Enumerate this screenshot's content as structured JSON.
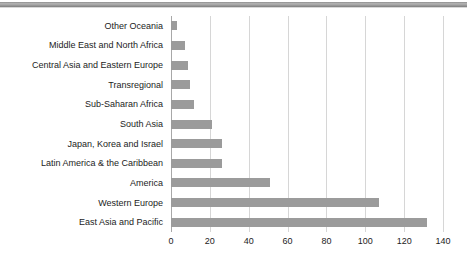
{
  "chart_data": {
    "type": "bar",
    "orientation": "horizontal",
    "title": "",
    "subtitle": "",
    "xlabel": "",
    "ylabel": "",
    "categories": [
      "Other Oceania",
      "Middle East and North Africa",
      "Central Asia and Eastern Europe",
      "Transregional",
      "Sub-Saharan Africa",
      "South Asia",
      "Japan, Korea and Israel",
      "Latin America & the Caribbean",
      "America",
      "Western Europe",
      "East Asia and Pacific"
    ],
    "values": [
      3,
      7,
      9,
      10,
      12,
      21,
      26,
      26,
      51,
      107,
      132
    ],
    "xlim": [
      0,
      140
    ],
    "xticks": [
      0,
      20,
      40,
      60,
      80,
      100,
      120,
      140
    ],
    "xtick_labels": [
      "0",
      "20",
      "40",
      "60",
      "80",
      "100",
      "120",
      "140"
    ],
    "grid": "vertical",
    "legend": "none",
    "bar_color": "#9b9b9b",
    "gridline_color": "#d6d6d6",
    "axis_color": "#a8a8a8",
    "text_color": "#1c1c1c",
    "background": "#ffffff"
  }
}
